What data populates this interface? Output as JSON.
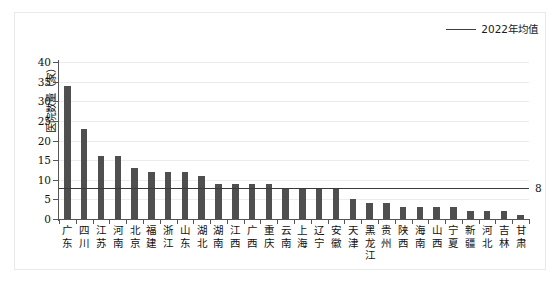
{
  "legend": {
    "label": "2022年均值",
    "line_color": "#3f3f3f"
  },
  "axes": {
    "ylabel": "医院数量（家）",
    "yticks": [
      "0",
      "5",
      "10",
      "15",
      "20",
      "25",
      "30",
      "35",
      "40"
    ],
    "ylim": [
      0,
      40
    ],
    "xlabel": ""
  },
  "average": {
    "value": 8,
    "label": "8"
  },
  "colors": {
    "bar": "#4f4f4f",
    "average_line": "#3a3a3a",
    "grid": "#ececec",
    "axis": "#555555",
    "background": "#ffffff",
    "frame": "#e9e9e9"
  },
  "chart_data": {
    "type": "bar",
    "title": "",
    "subtitle": "",
    "xlabel": "",
    "ylabel": "医院数量（家）",
    "ylim": [
      0,
      40
    ],
    "ytick_step": 5,
    "grid": true,
    "legend_position": "top-right",
    "categories": [
      "广东",
      "四川",
      "江苏",
      "河南",
      "北京",
      "福建",
      "浙江",
      "山东",
      "湖北",
      "湖南",
      "江西",
      "广西",
      "重庆",
      "云南",
      "上海",
      "辽宁",
      "安徽",
      "天津",
      "黑龙江",
      "贵州",
      "陕西",
      "海南",
      "山西",
      "宁夏",
      "新疆",
      "河北",
      "吉林",
      "甘肃"
    ],
    "series": [
      {
        "name": "医院数量（家）",
        "type": "bar",
        "values": [
          34,
          23,
          16,
          16,
          13,
          12,
          12,
          12,
          11,
          9,
          9,
          9,
          9,
          8,
          8,
          8,
          8,
          5,
          4,
          4,
          3,
          3,
          3,
          3,
          2,
          2,
          2,
          1
        ]
      },
      {
        "name": "2022年均值",
        "type": "line",
        "constant": 8
      }
    ],
    "annotations": [
      {
        "text": "8",
        "position": "right-of-average-line",
        "value": 8
      }
    ]
  }
}
